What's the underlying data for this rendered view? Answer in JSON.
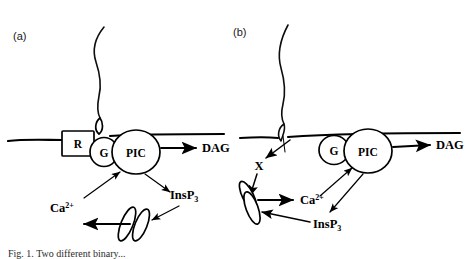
{
  "figure": {
    "kind": "signal-transduction-diagram",
    "background_color": "#ffffff",
    "ink_color": "#000000",
    "width": 476,
    "height": 259,
    "caption_visible_fragment": "Fig. 1. Two different binary...",
    "panels": [
      {
        "id": "a",
        "label": "(a)",
        "description": "Receptor-mediated activation: ligand binds surface receptor R coupled to G protein and PIC",
        "nodes": [
          {
            "name": "receptor",
            "label": "R",
            "shape": "rectangle"
          },
          {
            "name": "g-protein",
            "label": "G",
            "shape": "ellipse"
          },
          {
            "name": "pic-enzyme",
            "label": "PIC",
            "shape": "circle"
          }
        ],
        "products": [
          {
            "name": "dag",
            "label": "DAG"
          },
          {
            "name": "insp3",
            "label": "InsP",
            "subscript": "3"
          },
          {
            "name": "calcium",
            "label": "Ca",
            "superscript": "2+"
          }
        ],
        "organelle": {
          "name": "internal-store",
          "label": "",
          "shape": "double-cisterna"
        }
      },
      {
        "id": "b",
        "label": "(b)",
        "description": "Receptor-independent activation: signal passes membrane to intermediate X which mobilises internal calcium store",
        "nodes": [
          {
            "name": "intermediate-x",
            "label": "X",
            "shape": "text"
          },
          {
            "name": "g-protein",
            "label": "G",
            "shape": "ellipse"
          },
          {
            "name": "pic-enzyme",
            "label": "PIC",
            "shape": "circle"
          }
        ],
        "products": [
          {
            "name": "dag",
            "label": "DAG"
          },
          {
            "name": "insp3",
            "label": "InsP",
            "subscript": "3"
          },
          {
            "name": "calcium",
            "label": "Ca",
            "superscript": "2+"
          }
        ],
        "organelle": {
          "name": "internal-store",
          "label": "",
          "shape": "double-cisterna"
        }
      }
    ]
  }
}
